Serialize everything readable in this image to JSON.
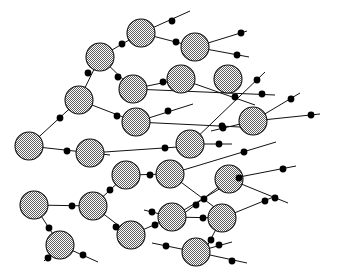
{
  "figure": {
    "type": "node-link-graph",
    "width": 337,
    "height": 275,
    "background_color": "#ffffff",
    "node_fill_description": "50% checkerboard dither gray stipple",
    "node_fill_color": "#a8a8a8",
    "node_stroke_color": "#111111",
    "edge_stroke_color": "#111111",
    "marker_color": "#000000",
    "node_count": 24,
    "edge_count": 43,
    "marker_count": 43
  },
  "chart_data": {
    "type": "scatter",
    "xlabel": "",
    "ylabel": "",
    "xlim": [
      0,
      337
    ],
    "ylim": [
      0,
      275
    ],
    "grid": false,
    "legend": "none",
    "nodes": [
      {
        "id": "n1",
        "x": 141,
        "y": 33,
        "r": 14
      },
      {
        "id": "n2",
        "x": 100,
        "y": 57,
        "r": 14
      },
      {
        "id": "n3",
        "x": 195,
        "y": 47,
        "r": 14
      },
      {
        "id": "n4",
        "x": 133,
        "y": 89,
        "r": 14
      },
      {
        "id": "n5",
        "x": 181,
        "y": 79,
        "r": 14
      },
      {
        "id": "n6",
        "x": 228,
        "y": 79,
        "r": 14
      },
      {
        "id": "n7",
        "x": 79,
        "y": 100,
        "r": 14
      },
      {
        "id": "n8",
        "x": 136,
        "y": 122,
        "r": 14
      },
      {
        "id": "n9",
        "x": 253,
        "y": 121,
        "r": 14
      },
      {
        "id": "n10",
        "x": 29,
        "y": 146,
        "r": 14
      },
      {
        "id": "n11",
        "x": 90,
        "y": 153,
        "r": 14
      },
      {
        "id": "n12",
        "x": 190,
        "y": 144,
        "r": 14
      },
      {
        "id": "n13",
        "x": 126,
        "y": 175,
        "r": 14
      },
      {
        "id": "n14",
        "x": 170,
        "y": 174,
        "r": 14
      },
      {
        "id": "n15",
        "x": 229,
        "y": 179,
        "r": 14
      },
      {
        "id": "n16",
        "x": 34,
        "y": 205,
        "r": 14
      },
      {
        "id": "n17",
        "x": 93,
        "y": 206,
        "r": 14
      },
      {
        "id": "n18",
        "x": 172,
        "y": 217,
        "r": 14
      },
      {
        "id": "n19",
        "x": 222,
        "y": 218,
        "r": 14
      },
      {
        "id": "n20",
        "x": 60,
        "y": 245,
        "r": 14
      },
      {
        "id": "n21",
        "x": 131,
        "y": 235,
        "r": 14
      },
      {
        "id": "n22",
        "x": 196,
        "y": 252,
        "r": 14
      },
      {
        "id": "n23",
        "x": 239,
        "y": 84,
        "r": 0
      },
      {
        "id": "n24",
        "x": 0,
        "y": 0,
        "r": 0
      }
    ],
    "edges": [
      {
        "from": "n1",
        "x1": 141,
        "y1": 33,
        "x2": 190,
        "y2": 11,
        "marker": [
          172,
          21
        ]
      },
      {
        "from": "n1",
        "x1": 141,
        "y1": 33,
        "x2": 100,
        "y2": 57,
        "marker": [
          122,
          44
        ]
      },
      {
        "from": "n1",
        "x1": 141,
        "y1": 33,
        "x2": 195,
        "y2": 47,
        "marker": [
          176,
          42
        ]
      },
      {
        "from": "n2",
        "x1": 100,
        "y1": 57,
        "x2": 79,
        "y2": 100,
        "marker": [
          88,
          73
        ]
      },
      {
        "from": "n2",
        "x1": 100,
        "y1": 57,
        "x2": 133,
        "y2": 89,
        "marker": [
          118,
          77
        ]
      },
      {
        "from": "n3",
        "x1": 195,
        "y1": 47,
        "x2": 249,
        "y2": 57,
        "marker": [
          237,
          55
        ]
      },
      {
        "from": "n3",
        "x1": 195,
        "y1": 47,
        "x2": 247,
        "y2": 31,
        "marker": [
          241,
          33
        ]
      },
      {
        "from": "n4",
        "x1": 133,
        "y1": 89,
        "x2": 181,
        "y2": 79,
        "marker": [
          163,
          82
        ]
      },
      {
        "from": "n4",
        "x1": 133,
        "y1": 89,
        "x2": 275,
        "y2": 95,
        "marker": [
          262,
          94
        ]
      },
      {
        "from": "n5",
        "x1": 181,
        "y1": 79,
        "x2": 255,
        "y2": 105,
        "marker": [
          235,
          97
        ]
      },
      {
        "from": "n7",
        "x1": 79,
        "y1": 100,
        "x2": 29,
        "y2": 146,
        "marker": [
          60,
          118
        ]
      },
      {
        "from": "n7",
        "x1": 79,
        "y1": 100,
        "x2": 136,
        "y2": 122,
        "marker": [
          117,
          116
        ]
      },
      {
        "from": "n8",
        "x1": 136,
        "y1": 122,
        "x2": 193,
        "y2": 104,
        "marker": [
          168,
          111
        ]
      },
      {
        "from": "n8",
        "x1": 136,
        "y1": 122,
        "x2": 240,
        "y2": 127,
        "marker": [
          222,
          126
        ]
      },
      {
        "from": "n9",
        "x1": 253,
        "y1": 121,
        "x2": 320,
        "y2": 114,
        "marker": [
          311,
          115
        ]
      },
      {
        "from": "n9",
        "x1": 253,
        "y1": 121,
        "x2": 300,
        "y2": 93,
        "marker": [
          291,
          99
        ]
      },
      {
        "from": "n9",
        "x1": 253,
        "y1": 121,
        "x2": 211,
        "y2": 131,
        "marker": [
          223,
          128
        ]
      },
      {
        "from": "n10",
        "x1": 29,
        "y1": 146,
        "x2": 110,
        "y2": 155,
        "marker": [
          67,
          151
        ]
      },
      {
        "from": "n11",
        "x1": 90,
        "y1": 153,
        "x2": 178,
        "y2": 147,
        "marker": [
          165,
          148
        ]
      },
      {
        "from": "n12",
        "x1": 190,
        "y1": 144,
        "x2": 232,
        "y2": 144,
        "marker": [
          219,
          144
        ]
      },
      {
        "from": "n12",
        "x1": 190,
        "y1": 144,
        "x2": 265,
        "y2": 72,
        "marker": [
          257,
          80
        ]
      },
      {
        "from": "n13",
        "x1": 126,
        "y1": 175,
        "x2": 170,
        "y2": 174,
        "marker": [
          150,
          175
        ]
      },
      {
        "from": "n13",
        "x1": 126,
        "y1": 175,
        "x2": 93,
        "y2": 206,
        "marker": [
          110,
          190
        ]
      },
      {
        "from": "n14",
        "x1": 170,
        "y1": 174,
        "x2": 276,
        "y2": 142,
        "marker": [
          244,
          152
        ]
      },
      {
        "from": "n14",
        "x1": 170,
        "y1": 174,
        "x2": 229,
        "y2": 218,
        "marker": [
          204,
          199
        ]
      },
      {
        "from": "n15",
        "x1": 229,
        "y1": 179,
        "x2": 296,
        "y2": 166,
        "marker": [
          283,
          169
        ]
      },
      {
        "from": "n15",
        "x1": 229,
        "y1": 179,
        "x2": 288,
        "y2": 203,
        "marker": [
          275,
          198
        ]
      },
      {
        "from": "n15",
        "x1": 229,
        "y1": 179,
        "x2": 178,
        "y2": 218,
        "marker": [
          196,
          205
        ]
      },
      {
        "from": "n16",
        "x1": 34,
        "y1": 205,
        "x2": 93,
        "y2": 206,
        "marker": [
          72,
          206
        ]
      },
      {
        "from": "n16",
        "x1": 34,
        "y1": 205,
        "x2": 60,
        "y2": 245,
        "marker": [
          49,
          228
        ]
      },
      {
        "from": "n17",
        "x1": 93,
        "y1": 206,
        "x2": 131,
        "y2": 235,
        "marker": [
          116,
          227
        ]
      },
      {
        "from": "n18",
        "x1": 172,
        "y1": 217,
        "x2": 222,
        "y2": 218,
        "marker": [
          203,
          218
        ]
      },
      {
        "from": "n18",
        "x1": 172,
        "y1": 217,
        "x2": 144,
        "y2": 210,
        "marker": [
          152,
          212
        ]
      },
      {
        "from": "n18",
        "x1": 172,
        "y1": 217,
        "x2": 243,
        "y2": 175,
        "marker": [
          239,
          178
        ]
      },
      {
        "from": "n19",
        "x1": 222,
        "y1": 218,
        "x2": 276,
        "y2": 196,
        "marker": [
          265,
          201
        ]
      },
      {
        "from": "n19",
        "x1": 222,
        "y1": 218,
        "x2": 205,
        "y2": 250,
        "marker": [
          211,
          240
        ]
      },
      {
        "from": "n20",
        "x1": 60,
        "y1": 245,
        "x2": 98,
        "y2": 262,
        "marker": [
          83,
          255
        ]
      },
      {
        "from": "n20",
        "x1": 60,
        "y1": 245,
        "x2": 44,
        "y2": 261,
        "marker": [
          48,
          258
        ]
      },
      {
        "from": "n21",
        "x1": 131,
        "y1": 235,
        "x2": 172,
        "y2": 217,
        "marker": [
          155,
          225
        ]
      },
      {
        "from": "n22",
        "x1": 196,
        "y1": 252,
        "x2": 152,
        "y2": 243,
        "marker": [
          166,
          246
        ]
      },
      {
        "from": "n22",
        "x1": 196,
        "y1": 252,
        "x2": 247,
        "y2": 263,
        "marker": [
          232,
          261
        ]
      },
      {
        "from": "n22",
        "x1": 196,
        "y1": 252,
        "x2": 232,
        "y2": 242,
        "marker": [
          219,
          245
        ]
      },
      {
        "from": "n6",
        "x1": 228,
        "y1": 79,
        "x2": 228,
        "y2": 79,
        "marker": [
          228,
          79
        ]
      }
    ]
  }
}
